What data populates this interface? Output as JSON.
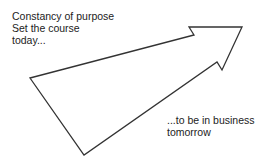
{
  "diagram": {
    "top_text": {
      "line1": "Constancy of purpose",
      "line2": "Set the course",
      "line3": "today..."
    },
    "bottom_text": {
      "line1": "...to be in business",
      "line2": "tomorrow"
    },
    "arrow": {
      "shape": "outlined-arrow",
      "stroke_color": "#333333",
      "points": "30,78 194,35 189,27 242,27 222,70 217,62 84,155"
    }
  }
}
